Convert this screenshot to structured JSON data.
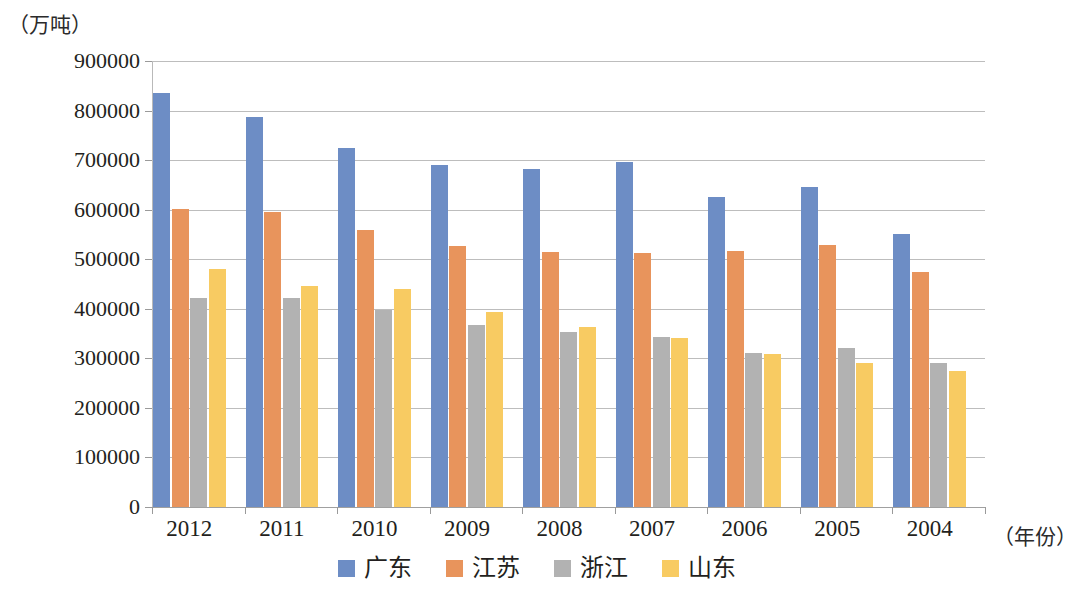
{
  "chart_data": {
    "type": "bar",
    "title": "",
    "subtitle": "",
    "xlabel": "（年份）",
    "ylabel": "（万吨）",
    "ylim": [
      0,
      900000
    ],
    "ytick_step": 100000,
    "yticks": [
      "900000",
      "800000",
      "700000",
      "600000",
      "500000",
      "400000",
      "300000",
      "200000",
      "100000",
      "0"
    ],
    "grid": true,
    "legend_position": "bottom",
    "categories": [
      "2012",
      "2011",
      "2010",
      "2009",
      "2008",
      "2007",
      "2006",
      "2005",
      "2004"
    ],
    "series": [
      {
        "name": "广东",
        "color": "#6d8dc5",
        "values": [
          836000,
          787000,
          724000,
          691000,
          683000,
          696000,
          625000,
          645000,
          551000
        ]
      },
      {
        "name": "江苏",
        "color": "#e8945c",
        "values": [
          601000,
          595000,
          558000,
          526000,
          514000,
          512000,
          516000,
          528000,
          475000
        ]
      },
      {
        "name": "浙江",
        "color": "#b2b2b2",
        "values": [
          421000,
          421000,
          398000,
          368000,
          354000,
          343000,
          310000,
          320000,
          291000
        ]
      },
      {
        "name": "山东",
        "color": "#f8cb62",
        "values": [
          481000,
          445000,
          440000,
          393000,
          364000,
          341000,
          308000,
          290000,
          274000
        ]
      }
    ]
  }
}
